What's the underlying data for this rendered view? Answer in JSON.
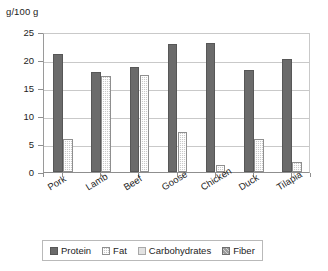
{
  "chart_data": {
    "type": "bar",
    "title": "",
    "subtitle": "",
    "ylabel": "g/100 g",
    "xlabel": "",
    "ylim": [
      0,
      25
    ],
    "ytick_labels": [
      "25",
      "20",
      "15",
      "10",
      "5",
      "0"
    ],
    "ytick_values": [
      25,
      20,
      15,
      10,
      5,
      0
    ],
    "ystep": 5,
    "grid": true,
    "legend_position": "bottom",
    "categories": [
      "Pork",
      "Lamb",
      "Beef",
      "Goose",
      "Chicken",
      "Duck",
      "Tilapia"
    ],
    "series": [
      {
        "name": "Protein",
        "color": "#6b6b6b",
        "values": [
          21.0,
          17.8,
          18.7,
          22.8,
          23.1,
          18.3,
          20.1
        ]
      },
      {
        "name": "Fat",
        "color": "#c9c9c9",
        "values": [
          5.9,
          17.1,
          17.3,
          7.1,
          1.2,
          5.9,
          1.7
        ]
      },
      {
        "name": "Carbohydrates",
        "color": "#e2e2e2",
        "values": [
          0,
          0,
          0,
          0,
          0,
          0,
          0
        ]
      },
      {
        "name": "Fiber",
        "color": "#9c9c9c",
        "values": [
          0,
          0,
          0,
          0,
          0,
          0,
          0
        ]
      }
    ]
  },
  "legend": {
    "items": [
      {
        "label": "Protein"
      },
      {
        "label": "Fat"
      },
      {
        "label": "Carbohydrates"
      },
      {
        "label": "Fiber"
      }
    ]
  },
  "colors": {
    "protein": "#6b6b6b",
    "fat": "#c9c9c9",
    "carbohydrates": "#e2e2e2",
    "fiber": "#9c9c9c",
    "axis": "#8f8f8f",
    "grid": "#c9c9c9",
    "text": "#1d1d1d",
    "background": "#ffffff"
  }
}
